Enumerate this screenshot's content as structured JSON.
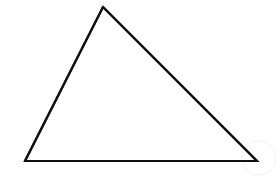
{
  "figure": {
    "type": "geometric-shape-diagram",
    "shape_name": "triangle",
    "shape_classification": "scalene acute triangle",
    "canvas": {
      "width": 280,
      "height": 185,
      "background_color": "#ffffff"
    },
    "stroke": {
      "color": "#111111",
      "width": 2.2,
      "linejoin": "miter",
      "linecap": "butt",
      "fill": "none"
    },
    "vertices": [
      {
        "label": "apex",
        "x": 103,
        "y": 7
      },
      {
        "label": "bottom-right",
        "x": 257,
        "y": 161
      },
      {
        "label": "bottom-left",
        "x": 25,
        "y": 161
      }
    ],
    "polygon_points": "103,7 257,161 25,161",
    "edges": [
      {
        "label": "left-edge",
        "from": "bottom-left",
        "to": "apex",
        "x1": 25,
        "y1": 161,
        "x2": 103,
        "y2": 7
      },
      {
        "label": "right-edge",
        "from": "apex",
        "to": "bottom-right",
        "x1": 103,
        "y1": 7,
        "x2": 257,
        "y2": 161
      },
      {
        "label": "base-edge",
        "from": "bottom-left",
        "to": "bottom-right",
        "x1": 25,
        "y1": 161,
        "x2": 257,
        "y2": 161
      }
    ],
    "artifact": {
      "name": "faint-arc-artifact",
      "color": "#f0f0f0",
      "stroke_width": 1,
      "cx": 259,
      "cy": 158,
      "r": 17
    }
  }
}
